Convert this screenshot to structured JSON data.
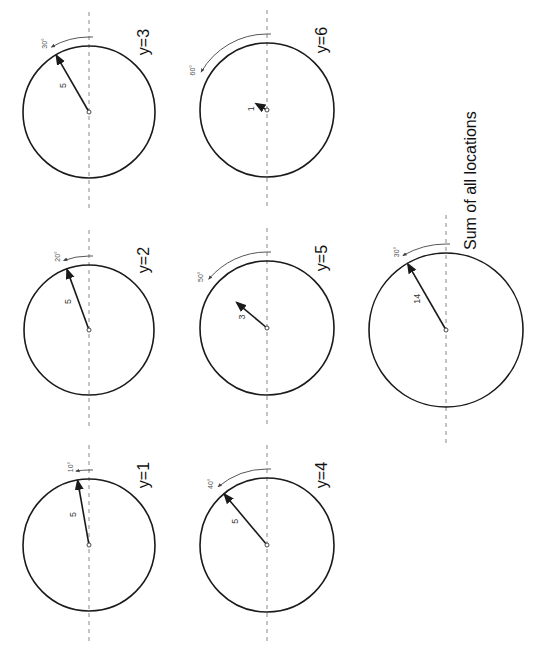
{
  "title": "Sum of all locations",
  "colors": {
    "circle": "#1a1a1a",
    "axis": "#8a8a8a",
    "text": "#111111"
  },
  "panels": [
    {
      "label": "y=1",
      "magnitude": 5,
      "magnitude_label": "5",
      "angle_deg": 10,
      "angle_label": "10°",
      "cx": 89,
      "cy": 545,
      "r": 66,
      "scale_max": 5
    },
    {
      "label": "y=2",
      "magnitude": 5,
      "magnitude_label": "5",
      "angle_deg": 20,
      "angle_label": "20°",
      "cx": 89,
      "cy": 330,
      "r": 65,
      "scale_max": 5
    },
    {
      "label": "y=3",
      "magnitude": 5,
      "magnitude_label": "5",
      "angle_deg": 30,
      "angle_label": "30°",
      "cx": 89,
      "cy": 112,
      "r": 66,
      "scale_max": 5
    },
    {
      "label": "y=4",
      "magnitude": 5,
      "magnitude_label": "5",
      "angle_deg": 40,
      "angle_label": "40°",
      "cx": 267,
      "cy": 545,
      "r": 67,
      "scale_max": 5
    },
    {
      "label": "y=5",
      "magnitude": 3,
      "magnitude_label": "3",
      "angle_deg": 50,
      "angle_label": "50°",
      "cx": 267,
      "cy": 328,
      "r": 67,
      "scale_max": 5
    },
    {
      "label": "y=6",
      "magnitude": 1,
      "magnitude_label": "1",
      "angle_deg": 60,
      "angle_label": "60°",
      "cx": 267,
      "cy": 110,
      "r": 67,
      "scale_max": 5
    }
  ],
  "sum": {
    "label": "Sum of all locations",
    "magnitude": 14,
    "magnitude_label": "14",
    "angle_deg": 30,
    "angle_label": "30°",
    "cx": 446,
    "cy": 330,
    "r": 77,
    "scale_max": 14
  }
}
